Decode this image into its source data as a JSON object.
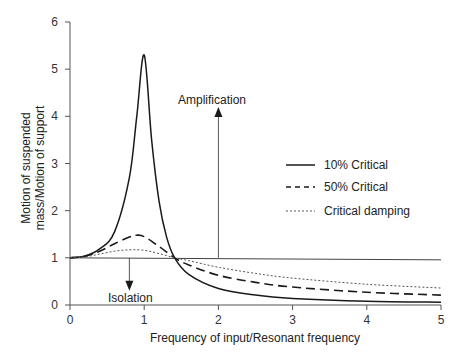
{
  "chart_data": {
    "type": "line",
    "title": "",
    "xlabel": "Frequency of input/Resonant frequency",
    "ylabel": "Motion of suspended mass/Motion of support",
    "ylabel_lines": [
      "Motion of suspended",
      "mass/Motion of support"
    ],
    "xlim": [
      0,
      5
    ],
    "ylim": [
      0,
      6
    ],
    "xticks": [
      "0",
      "1",
      "2",
      "3",
      "4",
      "5"
    ],
    "yticks": [
      "0",
      "1",
      "2",
      "3",
      "4",
      "5",
      "6"
    ],
    "grid": false,
    "legend_position": "right-center",
    "reference_line": {
      "y": 1,
      "x_range": [
        0,
        5
      ]
    },
    "series": [
      {
        "name": "10% Critical",
        "style": "solid",
        "x": [
          0,
          0.2,
          0.4,
          0.6,
          0.8,
          0.9,
          1.0,
          1.1,
          1.2,
          1.3,
          1.41,
          1.6,
          2.0,
          2.5,
          3.0,
          4.0,
          5.0
        ],
        "y": [
          1.0,
          1.04,
          1.19,
          1.55,
          2.7,
          4.0,
          5.3,
          3.5,
          2.2,
          1.45,
          1.0,
          0.65,
          0.35,
          0.21,
          0.14,
          0.08,
          0.06
        ]
      },
      {
        "name": "50% Critical",
        "style": "dashed",
        "x": [
          0,
          0.2,
          0.4,
          0.6,
          0.8,
          0.9,
          1.0,
          1.2,
          1.41,
          1.6,
          2.0,
          2.5,
          3.0,
          4.0,
          5.0
        ],
        "y": [
          1.0,
          1.03,
          1.14,
          1.3,
          1.44,
          1.48,
          1.45,
          1.24,
          1.0,
          0.85,
          0.63,
          0.48,
          0.38,
          0.27,
          0.21
        ]
      },
      {
        "name": "Critical damping",
        "style": "dotted",
        "x": [
          0,
          0.2,
          0.4,
          0.6,
          0.8,
          1.0,
          1.2,
          1.41,
          1.6,
          2.0,
          2.5,
          3.0,
          4.0,
          5.0
        ],
        "y": [
          1.0,
          1.02,
          1.08,
          1.14,
          1.17,
          1.16,
          1.09,
          1.0,
          0.94,
          0.8,
          0.67,
          0.57,
          0.44,
          0.36
        ]
      }
    ],
    "annotations": [
      {
        "text": "Amplification",
        "arrow": "up",
        "x": 2.0,
        "from_y": 1.0,
        "to_y": 4.2
      },
      {
        "text": "Isolation",
        "arrow": "down",
        "x": 0.8,
        "from_y": 1.0,
        "to_y": 0.3
      }
    ]
  },
  "legend": {
    "items": [
      {
        "label": "10% Critical",
        "style": "solid"
      },
      {
        "label": "50% Critical",
        "style": "dashed"
      },
      {
        "label": "Critical damping",
        "style": "dotted"
      }
    ]
  },
  "annotations": {
    "amplification": "Amplification",
    "isolation": "Isolation"
  },
  "colors": {
    "line": "#1a1a1a",
    "axis": "#555555",
    "reference": "#444444"
  }
}
